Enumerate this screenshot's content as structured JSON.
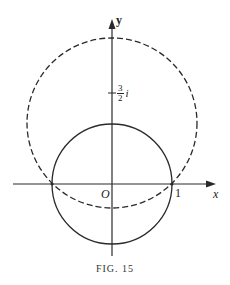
{
  "figure": {
    "caption": "FIG. 15",
    "axes": {
      "x_label": "x",
      "y_label": "y",
      "origin_label": "O"
    },
    "labels": {
      "x_tick": "1",
      "y_tick_numerator": "3",
      "y_tick_denominator": "2",
      "y_tick_suffix": "i"
    },
    "curves": [
      {
        "name": "unit-circle",
        "style": "solid",
        "center": [
          0,
          0
        ],
        "radius": 1
      },
      {
        "name": "image-circle",
        "style": "dashed",
        "center": [
          0,
          1.02
        ],
        "radius": 1.42
      }
    ],
    "colors": {
      "ink": "#222222",
      "background": "#ffffff"
    }
  }
}
